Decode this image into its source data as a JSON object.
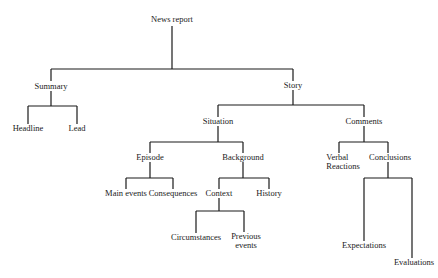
{
  "diagram": {
    "type": "tree",
    "nodes": {
      "root": "News report",
      "summary": "Summary",
      "headline": "Headline",
      "lead": "Lead",
      "story": "Story",
      "situation": "Situation",
      "episode": "Episode",
      "main_events": "Main events",
      "consequences": "Consequences",
      "background": "Background",
      "context": "Context",
      "circumstances": "Circumstances",
      "previous_events_1": "Previous",
      "previous_events_2": "events",
      "history": "History",
      "comments": "Comments",
      "verbal_reactions_1": "Verbal",
      "verbal_reactions_2": "Reactions",
      "conclusions": "Conclusions",
      "expectations": "Expectations",
      "evaluations": "Evaluations"
    },
    "edges": [
      [
        "News report",
        "Summary"
      ],
      [
        "News report",
        "Story"
      ],
      [
        "Summary",
        "Headline"
      ],
      [
        "Summary",
        "Lead"
      ],
      [
        "Story",
        "Situation"
      ],
      [
        "Story",
        "Comments"
      ],
      [
        "Situation",
        "Episode"
      ],
      [
        "Situation",
        "Background"
      ],
      [
        "Episode",
        "Main events"
      ],
      [
        "Episode",
        "Consequences"
      ],
      [
        "Background",
        "Context"
      ],
      [
        "Background",
        "History"
      ],
      [
        "Context",
        "Circumstances"
      ],
      [
        "Context",
        "Previous events"
      ],
      [
        "Comments",
        "Verbal Reactions"
      ],
      [
        "Comments",
        "Conclusions"
      ],
      [
        "Conclusions",
        "Expectations"
      ],
      [
        "Conclusions",
        "Evaluations"
      ]
    ]
  }
}
